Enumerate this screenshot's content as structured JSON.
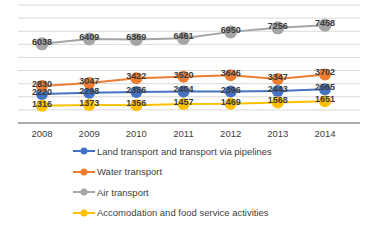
{
  "chart_data": {
    "type": "line",
    "categories": [
      "2008",
      "2009",
      "2010",
      "2011",
      "2012",
      "2013",
      "2014"
    ],
    "series": [
      {
        "name": "Land transport and transport via pipelines",
        "color": "#4472C4",
        "values": [
          2220,
          2298,
          2356,
          2404,
          2396,
          2443,
          2565
        ]
      },
      {
        "name": "Water transport",
        "color": "#ED7D31",
        "values": [
          2830,
          3047,
          3422,
          3520,
          3646,
          3347,
          3702
        ]
      },
      {
        "name": "Air transport",
        "color": "#A5A5A5",
        "values": [
          6038,
          6409,
          6369,
          6461,
          6950,
          7256,
          7458
        ]
      },
      {
        "name": "Accomodation and food service activities",
        "color": "#FFC000",
        "values": [
          1316,
          1373,
          1356,
          1457,
          1469,
          1568,
          1651
        ]
      }
    ],
    "title": "",
    "xlabel": "",
    "ylabel": "",
    "ylim": [
      0,
      9000
    ],
    "grid_step": 1000,
    "grid": true,
    "data_labels": true,
    "legend_position": "bottom-left",
    "colors": {
      "grid": "#d9d9d9",
      "axis": "#595959",
      "tick_text": "#404040",
      "data_label_text": "#3b3b3b",
      "background": "#ffffff"
    }
  }
}
